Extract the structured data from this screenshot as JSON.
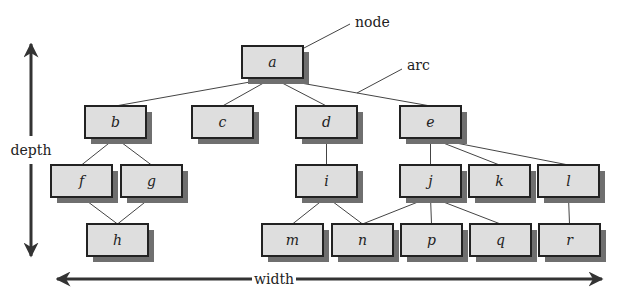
{
  "colors": {
    "node_fill": "#dedede",
    "node_border": "#222222",
    "shadow": "#6f6f6f",
    "edge": "#444444",
    "arrow": "#333333",
    "text": "#222222"
  },
  "annotations": {
    "node": "node",
    "arc": "arc",
    "depth": "depth",
    "width": "width"
  },
  "nodes": [
    {
      "id": "a",
      "label": "a",
      "x": 242,
      "y": 46
    },
    {
      "id": "b",
      "label": "b",
      "x": 85,
      "y": 106
    },
    {
      "id": "c",
      "label": "c",
      "x": 192,
      "y": 106
    },
    {
      "id": "d",
      "label": "d",
      "x": 296,
      "y": 106
    },
    {
      "id": "e",
      "label": "e",
      "x": 400,
      "y": 106
    },
    {
      "id": "f",
      "label": "f",
      "x": 51,
      "y": 165
    },
    {
      "id": "g",
      "label": "g",
      "x": 121,
      "y": 165
    },
    {
      "id": "i",
      "label": "i",
      "x": 296,
      "y": 165
    },
    {
      "id": "j",
      "label": "j",
      "x": 400,
      "y": 165
    },
    {
      "id": "k",
      "label": "k",
      "x": 469,
      "y": 165
    },
    {
      "id": "l",
      "label": "l",
      "x": 538,
      "y": 165
    },
    {
      "id": "h",
      "label": "h",
      "x": 87,
      "y": 224
    },
    {
      "id": "m",
      "label": "m",
      "x": 262,
      "y": 224
    },
    {
      "id": "n",
      "label": "n",
      "x": 332,
      "y": 224
    },
    {
      "id": "p",
      "label": "p",
      "x": 401,
      "y": 224
    },
    {
      "id": "q",
      "label": "q",
      "x": 470,
      "y": 224
    },
    {
      "id": "r",
      "label": "r",
      "x": 539,
      "y": 224
    }
  ],
  "edges": [
    [
      "a",
      "b"
    ],
    [
      "a",
      "c"
    ],
    [
      "a",
      "d"
    ],
    [
      "a",
      "e"
    ],
    [
      "b",
      "f"
    ],
    [
      "b",
      "g"
    ],
    [
      "f",
      "h"
    ],
    [
      "g",
      "h"
    ],
    [
      "d",
      "i"
    ],
    [
      "i",
      "m"
    ],
    [
      "i",
      "n"
    ],
    [
      "e",
      "j"
    ],
    [
      "e",
      "k"
    ],
    [
      "e",
      "l"
    ],
    [
      "j",
      "n"
    ],
    [
      "j",
      "p"
    ],
    [
      "j",
      "q"
    ],
    [
      "l",
      "r"
    ]
  ]
}
